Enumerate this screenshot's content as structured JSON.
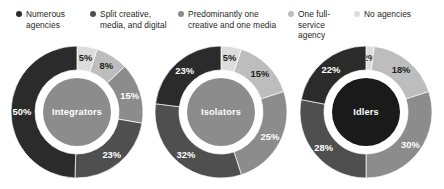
{
  "legend": {
    "items": [
      {
        "label": "Numerous\nagencies",
        "color": "#2b2b2b",
        "icon": "legend-dot-icon"
      },
      {
        "label": "Split creative,\nmedia, and digital",
        "color": "#4f4f4f",
        "icon": "legend-dot-icon"
      },
      {
        "label": "Predominantly one\ncreative and one media",
        "color": "#8c8c8c",
        "icon": "legend-dot-icon"
      },
      {
        "label": "One full-service\nagency",
        "color": "#bdbdbd",
        "icon": "legend-dot-icon"
      },
      {
        "label": "No agencies",
        "color": "#dcdcdc",
        "icon": "legend-dot-icon"
      }
    ]
  },
  "chart_data": {
    "type": "pie",
    "title": "",
    "xlabel": "",
    "ylabel": "",
    "legend_position": "top",
    "grid": false,
    "categories": [
      "Numerous agencies",
      "Split creative, media, and digital",
      "Predominantly one creative and one media",
      "One full-service agency",
      "No agencies"
    ],
    "colors": [
      "#2b2b2b",
      "#4f4f4f",
      "#8c8c8c",
      "#bdbdbd",
      "#dcdcdc"
    ],
    "charts": [
      {
        "name": "Integrators",
        "center_label": "Integrators",
        "center_color": "#8c8c8c",
        "slices": [
          {
            "category": "No agencies",
            "value": 5,
            "label": "5%",
            "color": "#dcdcdc",
            "label_color": "#231f20"
          },
          {
            "category": "One full-service agency",
            "value": 8,
            "label": "8%",
            "color": "#bdbdbd",
            "label_color": "#231f20"
          },
          {
            "category": "Predominantly one creative and one media",
            "value": 15,
            "label": "15%",
            "color": "#8c8c8c",
            "label_color": "#ffffff"
          },
          {
            "category": "Split creative, media, and digital",
            "value": 23,
            "label": "23%",
            "color": "#4f4f4f",
            "label_color": "#ffffff"
          },
          {
            "category": "Numerous agencies",
            "value": 50,
            "label": "50%",
            "color": "#2b2b2b",
            "label_color": "#ffffff"
          }
        ]
      },
      {
        "name": "Isolators",
        "center_label": "Isolators",
        "center_color": "#8c8c8c",
        "slices": [
          {
            "category": "No agencies",
            "value": 5,
            "label": "5%",
            "color": "#dcdcdc",
            "label_color": "#231f20"
          },
          {
            "category": "One full-service agency",
            "value": 15,
            "label": "15%",
            "color": "#bdbdbd",
            "label_color": "#231f20"
          },
          {
            "category": "Predominantly one creative and one media",
            "value": 25,
            "label": "25%",
            "color": "#8c8c8c",
            "label_color": "#ffffff"
          },
          {
            "category": "Split creative, media, and digital",
            "value": 32,
            "label": "32%",
            "color": "#4f4f4f",
            "label_color": "#ffffff"
          },
          {
            "category": "Numerous agencies",
            "value": 23,
            "label": "23%",
            "color": "#2b2b2b",
            "label_color": "#ffffff"
          }
        ]
      },
      {
        "name": "Idlers",
        "center_label": "Idlers",
        "center_color": "#1a1a1a",
        "slices": [
          {
            "category": "No agencies",
            "value": 2,
            "label": "2%",
            "color": "#dcdcdc",
            "label_color": "#231f20"
          },
          {
            "category": "One full-service agency",
            "value": 18,
            "label": "18%",
            "color": "#bdbdbd",
            "label_color": "#231f20"
          },
          {
            "category": "Predominantly one creative and one media",
            "value": 30,
            "label": "30%",
            "color": "#8c8c8c",
            "label_color": "#ffffff"
          },
          {
            "category": "Split creative, media, and digital",
            "value": 28,
            "label": "28%",
            "color": "#4f4f4f",
            "label_color": "#ffffff"
          },
          {
            "category": "Numerous agencies",
            "value": 22,
            "label": "22%",
            "color": "#2b2b2b",
            "label_color": "#ffffff"
          }
        ]
      }
    ]
  }
}
